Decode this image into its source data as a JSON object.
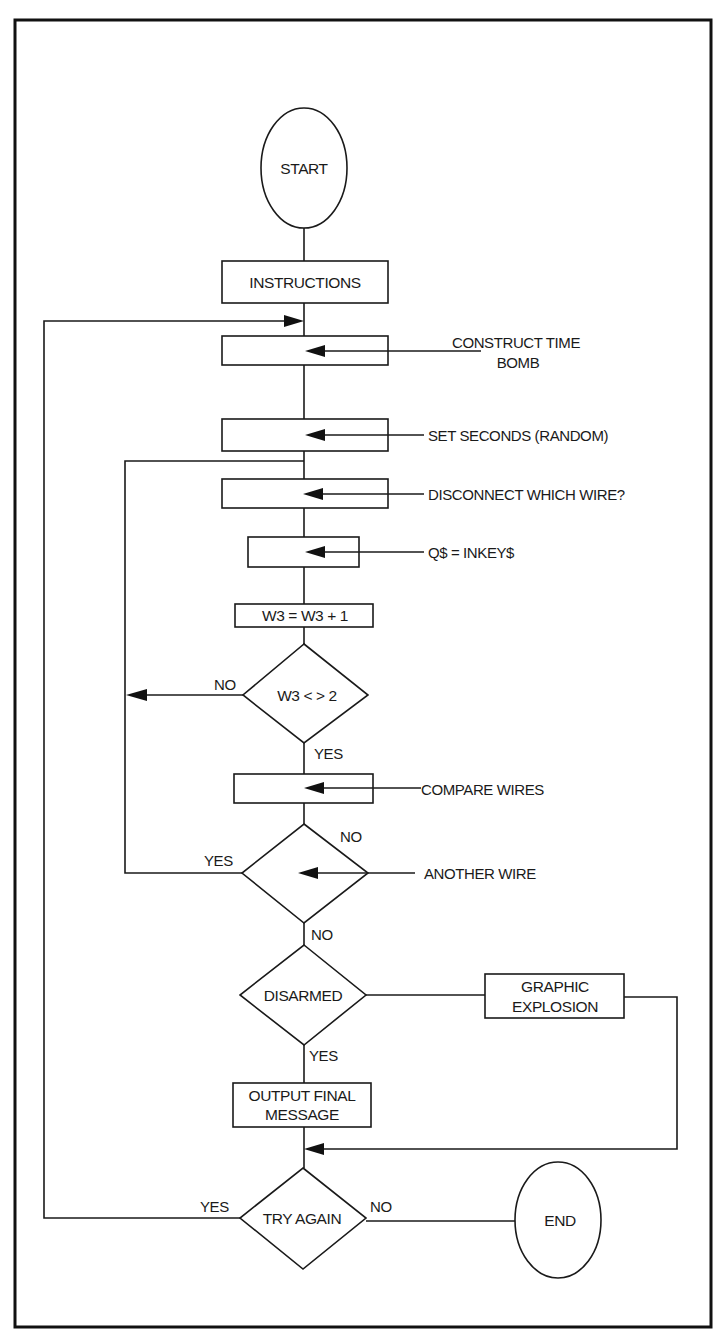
{
  "diagram": {
    "type": "flowchart",
    "colors": {
      "ink": "#1a1a1a",
      "paper": "#ffffff"
    },
    "nodes": {
      "start": {
        "shape": "terminal",
        "label": "START"
      },
      "instructions": {
        "shape": "process",
        "label": "INSTRUCTIONS"
      },
      "construct": {
        "shape": "process",
        "label": "",
        "annotation": [
          "CONSTRUCT TIME",
          "BOMB"
        ]
      },
      "set_seconds": {
        "shape": "process",
        "label": "",
        "annotation": "SET SECONDS (RANDOM)"
      },
      "disconnect": {
        "shape": "process",
        "label": "",
        "annotation": "DISCONNECT WHICH WIRE?"
      },
      "inkey": {
        "shape": "process",
        "label": "",
        "annotation": "Q$ = INKEY$"
      },
      "increment": {
        "shape": "process",
        "label": "W3 = W3 + 1"
      },
      "check_w3": {
        "shape": "decision",
        "label": "W3 < > 2",
        "no": "NO",
        "yes": "YES"
      },
      "compare": {
        "shape": "process",
        "label": "",
        "annotation": "COMPARE WIRES"
      },
      "another_wire": {
        "shape": "decision",
        "label": "",
        "annotation": "ANOTHER WIRE",
        "no_right": "NO",
        "yes": "YES",
        "no_bottom": "NO"
      },
      "disarmed": {
        "shape": "decision",
        "label": "DISARMED",
        "yes": "YES"
      },
      "explosion": {
        "shape": "process",
        "label": [
          "GRAPHIC",
          "EXPLOSION"
        ]
      },
      "output_final": {
        "shape": "process",
        "label": [
          "OUTPUT FINAL",
          "MESSAGE"
        ]
      },
      "try_again": {
        "shape": "decision",
        "label": "TRY AGAIN",
        "yes": "YES",
        "no": "NO"
      },
      "end": {
        "shape": "terminal",
        "label": "END"
      }
    },
    "edges": [
      {
        "from": "start",
        "to": "instructions"
      },
      {
        "from": "instructions",
        "to": "construct"
      },
      {
        "from": "construct",
        "to": "set_seconds"
      },
      {
        "from": "set_seconds",
        "to": "disconnect"
      },
      {
        "from": "disconnect",
        "to": "inkey"
      },
      {
        "from": "inkey",
        "to": "increment"
      },
      {
        "from": "increment",
        "to": "check_w3"
      },
      {
        "from": "check_w3",
        "to": "disconnect",
        "label": "NO"
      },
      {
        "from": "check_w3",
        "to": "compare",
        "label": "YES"
      },
      {
        "from": "compare",
        "to": "another_wire"
      },
      {
        "from": "another_wire",
        "to": "disconnect",
        "label": "YES"
      },
      {
        "from": "another_wire",
        "to": "disarmed",
        "label": "NO"
      },
      {
        "from": "disarmed",
        "to": "output_final",
        "label": "YES"
      },
      {
        "from": "disarmed",
        "to": "explosion"
      },
      {
        "from": "explosion",
        "to": "try_again"
      },
      {
        "from": "output_final",
        "to": "try_again"
      },
      {
        "from": "try_again",
        "to": "construct",
        "label": "YES"
      },
      {
        "from": "try_again",
        "to": "end",
        "label": "NO"
      }
    ]
  }
}
